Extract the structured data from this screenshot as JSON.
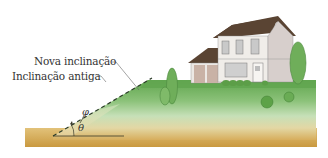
{
  "figure": {
    "labels": {
      "new_slope": "Nova inclinação",
      "old_slope": "Inclinação antiga",
      "angle_phi": "φ",
      "angle_theta": "θ"
    },
    "colors": {
      "grass_top": "#6aaa55",
      "grass_mid": "#a8cf93",
      "soil": "#d9b367",
      "soil_dark": "#c79b48",
      "roof": "#5a4433",
      "wall": "#ece8e4",
      "wall_shade": "#d7cfcc",
      "garage_door": "#c9b2a6",
      "tree": "#6fae5a",
      "dashed_line": "#2d3d2a",
      "text": "#333333"
    }
  }
}
